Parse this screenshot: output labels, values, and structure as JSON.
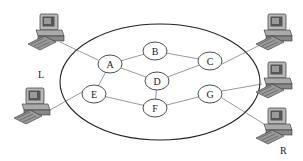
{
  "diagram": {
    "type": "network-topology",
    "boundary": {
      "shape": "ellipse",
      "cx": 160,
      "cy": 82,
      "rx": 100,
      "ry": 58
    },
    "nodes": [
      {
        "id": "A",
        "label": "A",
        "x": 110,
        "y": 64
      },
      {
        "id": "B",
        "label": "B",
        "x": 155,
        "y": 51
      },
      {
        "id": "C",
        "label": "C",
        "x": 210,
        "y": 61
      },
      {
        "id": "D",
        "label": "D",
        "x": 157,
        "y": 81
      },
      {
        "id": "E",
        "label": "E",
        "x": 94,
        "y": 94
      },
      {
        "id": "F",
        "label": "F",
        "x": 155,
        "y": 108
      },
      {
        "id": "G",
        "label": "G",
        "x": 210,
        "y": 94
      }
    ],
    "edges": [
      [
        "A",
        "B"
      ],
      [
        "A",
        "D"
      ],
      [
        "A",
        "E"
      ],
      [
        "B",
        "C"
      ],
      [
        "D",
        "C"
      ],
      [
        "D",
        "F"
      ],
      [
        "E",
        "F"
      ],
      [
        "F",
        "G"
      ]
    ],
    "hosts": [
      {
        "id": "host-left-top",
        "x": 38,
        "y": 16,
        "connects_to": "A"
      },
      {
        "id": "host-left-bottom",
        "x": 23,
        "y": 92,
        "connects_to": "E"
      },
      {
        "id": "host-right-top",
        "x": 262,
        "y": 16,
        "connects_to": "C"
      },
      {
        "id": "host-right-middle",
        "x": 262,
        "y": 63,
        "connects_to": "G"
      },
      {
        "id": "host-right-bottom",
        "x": 262,
        "y": 110,
        "connects_to": "G"
      }
    ],
    "side_labels": {
      "left": "L",
      "right": "R"
    }
  }
}
